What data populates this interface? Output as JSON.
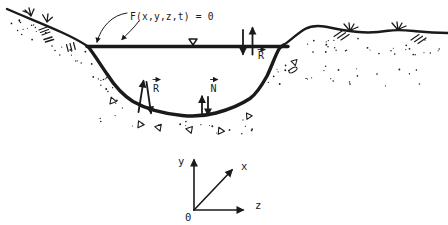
{
  "diagram": {
    "surface_equation_label": "F(x,y,z,t) = 0",
    "vectors": {
      "bed_reaction": "R",
      "surface_reaction": "R",
      "bed_normal": "N"
    },
    "axes": {
      "x": "x",
      "y": "y",
      "z": "z",
      "origin": "0"
    }
  },
  "colors": {
    "ink": "#1a1a1a",
    "paper": "#ffffff"
  }
}
